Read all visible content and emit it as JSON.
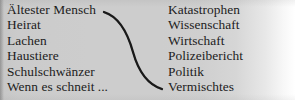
{
  "figure": {
    "kind": "two-column-mapping-list",
    "background_color": "#cdcdcd",
    "text_color": "#1c1c1c",
    "connector_color": "#1a1a1a"
  },
  "left_column": {
    "name": "topics",
    "items": [
      {
        "label": "Ältester Mensch"
      },
      {
        "label": "Heirat"
      },
      {
        "label": "Lachen"
      },
      {
        "label": "Haustiere"
      },
      {
        "label": "Schulschwänzer"
      },
      {
        "label": "Wenn es schneit ..."
      }
    ]
  },
  "right_column": {
    "name": "categories",
    "items": [
      {
        "label": "Katastrophen"
      },
      {
        "label": "Wissenschaft"
      },
      {
        "label": "Wirtschaft"
      },
      {
        "label": "Polizeibericht"
      },
      {
        "label": "Politik"
      },
      {
        "label": "Vermischtes"
      }
    ]
  },
  "connector": {
    "type": "curved-line",
    "icon": "s-curve-connector-icon",
    "from": {
      "x": 104,
      "y": 12
    },
    "to": {
      "x": 162,
      "y": 89
    },
    "path": "M 104 12 C 120 17, 128 34, 133 52 C 138 70, 146 84, 162 89"
  }
}
